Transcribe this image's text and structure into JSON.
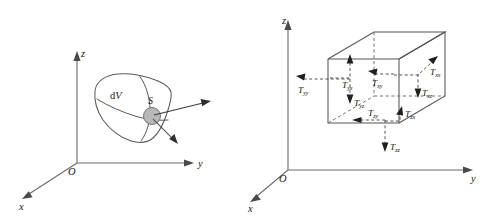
{
  "figure": {
    "panels": [
      {
        "id": "left",
        "name": "differential-volume-with-surface-patch",
        "axes": {
          "z_label": "z",
          "y_label": "y",
          "x_label": "x",
          "origin_label": "O"
        },
        "labels": {
          "volume": "dV",
          "surface_patch": "S"
        },
        "vectors": [
          {
            "name": "traction-vector-upper",
            "direction": "up-right"
          },
          {
            "name": "normal-vector-lower",
            "direction": "down-right"
          }
        ]
      },
      {
        "id": "right",
        "name": "stress-tensor-cube",
        "axes": {
          "z_label": "z",
          "y_label": "y",
          "x_label": "x",
          "origin_label": "O"
        },
        "stress_components": [
          {
            "name": "T_yx",
            "symbol": "T",
            "subscript": "yx",
            "arrow": "up"
          },
          {
            "name": "T_xy",
            "symbol": "T",
            "subscript": "xy",
            "arrow": "left-up"
          },
          {
            "name": "T_xx",
            "symbol": "T",
            "subscript": "xx",
            "arrow": "up-right"
          },
          {
            "name": "T_yy",
            "symbol": "T",
            "subscript": "yy",
            "arrow": "left"
          },
          {
            "name": "T_xz",
            "symbol": "T",
            "subscript": "xz",
            "arrow": "down"
          },
          {
            "name": "T_yz",
            "symbol": "T",
            "subscript": "yz",
            "arrow": "down"
          },
          {
            "name": "T_zy",
            "symbol": "T",
            "subscript": "zy",
            "arrow": "left"
          },
          {
            "name": "T_zx",
            "symbol": "T",
            "subscript": "zx",
            "arrow": "up"
          },
          {
            "name": "T_zz",
            "symbol": "T",
            "subscript": "zz",
            "arrow": "down"
          }
        ]
      }
    ]
  },
  "colors": {
    "background": "#ffffff",
    "axis": "#6b6b6b",
    "outline": "#555555",
    "dashed": "#6d6d6d",
    "patch_fill": "#b8b8b8",
    "text": "#1a1a1a"
  }
}
